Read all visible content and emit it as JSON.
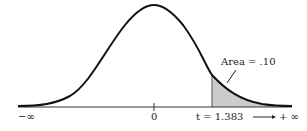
{
  "diagram": {
    "type": "t-distribution curve with shaded right tail",
    "labels": {
      "neg_inf": "−∞",
      "zero": "0",
      "t_value": "t = 1.383",
      "pos_inf": "⟶ + ∞",
      "area": "Area = .10"
    },
    "colors": {
      "curve": "#111111",
      "axis": "#333333",
      "shade": "#cccccc"
    }
  }
}
